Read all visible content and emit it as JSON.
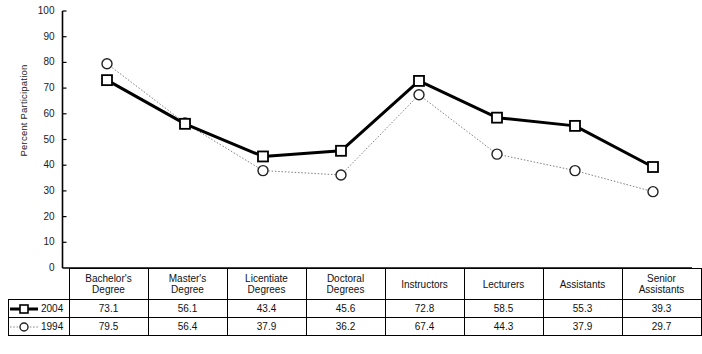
{
  "chart_data": {
    "type": "line",
    "title": "",
    "xlabel": "",
    "ylabel": "Percent Participation",
    "ylim": [
      0,
      100
    ],
    "ytick_step": 10,
    "yticks": [
      100,
      90,
      80,
      70,
      60,
      50,
      40,
      30,
      20,
      10,
      0
    ],
    "grid": false,
    "legend_position": "table-left-column",
    "categories": [
      "Bachelor's Degree",
      "Master's Degree",
      "Licentiate Degrees",
      "Doctoral Degrees",
      "Instructors",
      "Lecturers",
      "Assistants",
      "Senior Assistants"
    ],
    "series": [
      {
        "name": "2004",
        "values": [
          73.1,
          56.1,
          43.4,
          45.6,
          72.8,
          58.5,
          55.3,
          39.3
        ],
        "marker": "square",
        "line_style": "solid",
        "color": "#000000",
        "line_width": 3
      },
      {
        "name": "1994",
        "values": [
          79.5,
          56.4,
          37.9,
          36.2,
          67.4,
          44.3,
          37.9,
          29.7
        ],
        "marker": "circle",
        "line_style": "dotted",
        "color": "#808080",
        "line_width": 1
      }
    ]
  },
  "table": {
    "header_labels": [
      [
        "Bachelor's",
        "Degree"
      ],
      [
        "Master's",
        "Degree"
      ],
      [
        "Licentiate",
        "Degrees"
      ],
      [
        "Doctoral",
        "Degrees"
      ],
      [
        "Instructors",
        ""
      ],
      [
        "Lecturers",
        ""
      ],
      [
        "Assistants",
        ""
      ],
      [
        "Senior",
        "Assistants"
      ]
    ],
    "rows": [
      {
        "label": "2004",
        "values": [
          "73.1",
          "56.1",
          "43.4",
          "45.6",
          "72.8",
          "58.5",
          "55.3",
          "39.3"
        ]
      },
      {
        "label": "1994",
        "values": [
          "79.5",
          "56.4",
          "37.9",
          "36.2",
          "67.4",
          "44.3",
          "37.9",
          "29.7"
        ]
      }
    ]
  },
  "axis": {
    "y_title": "Percent Participation",
    "tick_labels": [
      "100",
      "90",
      "80",
      "70",
      "60",
      "50",
      "40",
      "30",
      "20",
      "10",
      "0"
    ]
  },
  "colors": {
    "series_2004": "#000000",
    "series_1994": "#808080",
    "axis": "#000000",
    "background": "#ffffff"
  }
}
